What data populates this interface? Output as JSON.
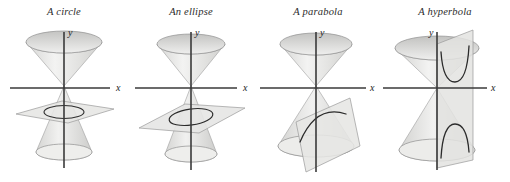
{
  "figure": {
    "background_color": "#ffffff",
    "width": 510,
    "height": 182,
    "cone_fill": "#e9e9e7",
    "cone_edge": "#8c8c8c",
    "plane_fill": "#e4e4e2",
    "plane_edge": "#9a9a9a",
    "axis_color": "#3a3a3a",
    "curve_color": "#2b2b2b"
  },
  "panels": [
    {
      "title": "A circle",
      "x_axis_label": "x",
      "y_axis_label": "y",
      "conic": "circle",
      "plane_orientation": "horizontal",
      "curve": "closed-circle"
    },
    {
      "title": "An ellipse",
      "x_axis_label": "x",
      "y_axis_label": "y",
      "conic": "ellipse",
      "plane_orientation": "tilted",
      "curve": "closed-ellipse"
    },
    {
      "title": "A parabola",
      "x_axis_label": "x",
      "y_axis_label": "y",
      "conic": "parabola",
      "plane_orientation": "parallel-to-slant",
      "curve": "open-parabola"
    },
    {
      "title": "A hyperbola",
      "x_axis_label": "x",
      "y_axis_label": "y",
      "conic": "hyperbola",
      "plane_orientation": "vertical",
      "curve": "two-branch-hyperbola"
    }
  ]
}
